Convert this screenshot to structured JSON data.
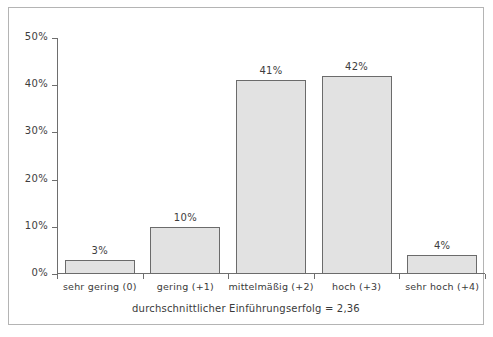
{
  "chart_data": {
    "type": "bar",
    "title": "",
    "subtitle": "",
    "xlabel": "",
    "ylabel": "",
    "categories": [
      "sehr gering (0)",
      "gering (+1)",
      "mittelmäßig (+2)",
      "hoch (+3)",
      "sehr hoch (+4)"
    ],
    "values": [
      3,
      10,
      41,
      42,
      4
    ],
    "value_labels": [
      "3%",
      "10%",
      "41%",
      "42%",
      "4%"
    ],
    "ylim": [
      0,
      50
    ],
    "ytick_values": [
      0,
      10,
      20,
      30,
      40,
      50
    ],
    "ytick_labels": [
      "0%",
      "10%",
      "20%",
      "30%",
      "40%",
      "50%"
    ],
    "grid": false,
    "legend": false,
    "bar_fill": "#e2e2e2",
    "bar_border": "#6b6b6b",
    "axis_color": "#6e6e6e",
    "text_color": "#3a3a3a"
  },
  "caption": {
    "text": "durchschnittlicher Einführungserfolg = 2,36"
  }
}
